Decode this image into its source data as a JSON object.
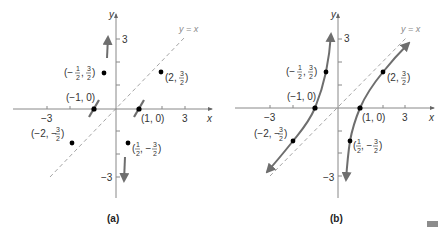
{
  "panels": [
    {
      "id": "a",
      "caption": "(a)",
      "origin_px": [
        116,
        109
      ],
      "unit_px": 23,
      "axis_labels": {
        "x": "x",
        "y": "y"
      },
      "tick_labels": {
        "x_neg": "−3",
        "x_pos": "3",
        "y_pos": "3",
        "y_neg": "−3"
      },
      "asymptote_label": "y = x",
      "points": [
        {
          "x": -1,
          "y": 0,
          "label": "(−1, 0)"
        },
        {
          "x": 1,
          "y": 0,
          "label": "(1, 0)"
        },
        {
          "x": -0.5,
          "y": 1.5,
          "label": "(−½, ¾)",
          "label_num": [
            "−1",
            "3"
          ],
          "label_den": [
            "2",
            "2"
          ]
        },
        {
          "x": 2,
          "y": 1.5,
          "label": "(2, 3/2)"
        },
        {
          "x": -2,
          "y": -1.5,
          "label": "(−2, −3/2)"
        },
        {
          "x": 0.5,
          "y": -1.5,
          "label": "(1/2, −3/2)"
        }
      ],
      "features": [
        "tangent segments at x-intercepts",
        "up arrow near x=-1/2",
        "down arrow near x=1/2",
        "dashed line y=x"
      ]
    },
    {
      "id": "b",
      "caption": "(b)",
      "origin_px": [
        338,
        108
      ],
      "unit_px": 22.5,
      "axis_labels": {
        "x": "x",
        "y": "y"
      },
      "tick_labels": {
        "x_neg": "−3",
        "x_pos": "3",
        "y_pos": "3",
        "y_neg": "−3"
      },
      "asymptote_label": "y = x",
      "points": [
        {
          "x": -1,
          "y": 0,
          "label": "(−1, 0)"
        },
        {
          "x": 1,
          "y": 0,
          "label": "(1, 0)"
        },
        {
          "x": -0.5,
          "y": 1.5,
          "label": "(−1/2, 3/2)"
        },
        {
          "x": 2,
          "y": 1.5,
          "label": "(2, 3/2)"
        },
        {
          "x": -2,
          "y": -1.5,
          "label": "(−2, −3/2)"
        },
        {
          "x": 0.5,
          "y": -1.5,
          "label": "(1/2, −3/2)"
        }
      ],
      "features": [
        "two curve branches with arrows",
        "dashed line y=x asymptote"
      ]
    }
  ],
  "labels": {
    "a_caption": "(a)",
    "b_caption": "(b)",
    "yx": "y = x",
    "x": "x",
    "y": "y",
    "three": "3",
    "neg_three": "−3",
    "m1_0": "(−1, 0)",
    "p1_0": "(1, 0)",
    "two": "(2, ",
    "neg_two": "(−2, −",
    "neg": "(−",
    "half_neg": ", −",
    "comma": ", ",
    "close": ")",
    "one": "1",
    "den": "2",
    "num3": "3"
  },
  "colors": {
    "axis": "#888888",
    "curve": "#6e6e6e",
    "dashed": "#9a9a9a",
    "point": "#000000",
    "corner_mark": "#8c8c8c"
  }
}
